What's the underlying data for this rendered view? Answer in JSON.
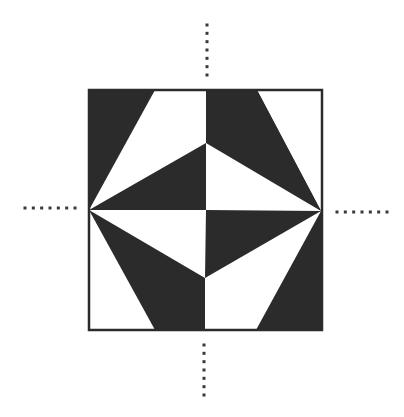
{
  "diagram": {
    "type": "geometric-tile-pattern",
    "colors": {
      "dark": "#2b2b2b",
      "light": "#ffffff",
      "border": "#2b2b2b",
      "dots": "#3a3a3a"
    },
    "square": {
      "x": 89,
      "y": 90,
      "w": 233,
      "h": 240
    },
    "dark_polygons": [
      {
        "name": "top-left-dark",
        "points": "89,90 155,90 89,210"
      },
      {
        "name": "top-right-dark",
        "points": "205,90 257,90 321,211"
      },
      {
        "name": "upper-center-left-dark",
        "points": "89,210 206,143 206,210"
      },
      {
        "name": "center-right-dark",
        "points": "206,210 321,211 205,278"
      },
      {
        "name": "lower-left-dark",
        "points": "89,210 205,278 205,330 155,330"
      },
      {
        "name": "bottom-right-dark",
        "points": "321,211 322,330 256,330"
      },
      {
        "name": "upper-right-column-dark",
        "points": "206,90 206,143 321,211 257,90"
      }
    ],
    "guides": [
      {
        "name": "top-guide",
        "orientation": "vertical",
        "x": 207,
        "y1": 25,
        "y2": 75,
        "count": 7
      },
      {
        "name": "bottom-guide",
        "orientation": "vertical",
        "x": 204,
        "y1": 345,
        "y2": 395,
        "count": 7
      },
      {
        "name": "left-guide",
        "orientation": "horizontal",
        "y": 208,
        "x1": 25,
        "x2": 75,
        "count": 7
      },
      {
        "name": "right-guide",
        "orientation": "horizontal",
        "y": 212,
        "x1": 337,
        "x2": 387,
        "count": 7
      }
    ]
  }
}
